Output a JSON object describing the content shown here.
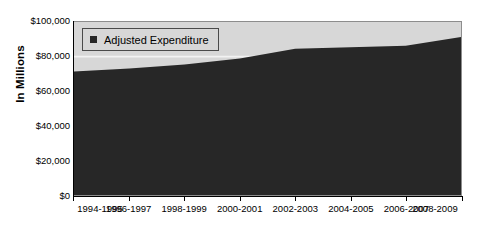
{
  "chart_data": {
    "type": "area",
    "title": "",
    "xlabel": "",
    "ylabel": "In Millions",
    "ylim": [
      0,
      100000
    ],
    "grid": false,
    "legend_position": "top-left",
    "series": [
      {
        "name": "Adjusted Expenditure",
        "color": "#272727",
        "values": [
          71400,
          73100,
          75400,
          78900,
          84600,
          85400,
          86300,
          91400
        ]
      }
    ],
    "categories": [
      "1994-1995",
      "1996-1997",
      "1998-1999",
      "2000-2001",
      "2002-2003",
      "2004-2005",
      "2006-2007",
      "2008-2009"
    ],
    "y_ticks": [
      {
        "value": 100000,
        "label": "$100,000"
      },
      {
        "value": 80000,
        "label": "$80,000"
      },
      {
        "value": 60000,
        "label": "$60,000"
      },
      {
        "value": 40000,
        "label": "$40,000"
      },
      {
        "value": 20000,
        "label": "$20,000"
      },
      {
        "value": 0,
        "label": "$0"
      }
    ],
    "plot_background": "#d7d7d7",
    "page_background": "#ffffff"
  },
  "axis": {
    "y_title": "In Millions"
  },
  "legend": {
    "entries": [
      {
        "label": "Adjusted Expenditure",
        "swatch": "legend-swatch-dark"
      }
    ]
  }
}
